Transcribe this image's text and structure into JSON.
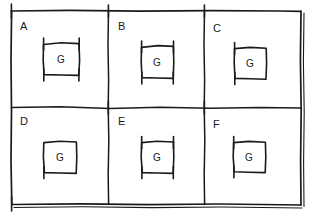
{
  "figure": {
    "type": "hand-drawn-diagram",
    "ink_color": "#1a1a1a",
    "background_color": "#ffffff",
    "rows": 2,
    "columns": 3
  },
  "panels": [
    {
      "id": "panel-a",
      "label": "A",
      "label_x": 20,
      "label_y": 20,
      "inner_box": {
        "label": "G",
        "x": 43,
        "y": 42,
        "width": 36,
        "height": 33,
        "ticks": [
          "top-left",
          "top-right",
          "bottom-left",
          "bottom-right"
        ]
      }
    },
    {
      "id": "panel-b",
      "label": "B",
      "label_x": 118,
      "label_y": 20,
      "inner_box": {
        "label": "G",
        "x": 141,
        "y": 45,
        "width": 32,
        "height": 33,
        "ticks": [
          "top-left",
          "top-right",
          "bottom-left",
          "bottom-right"
        ]
      }
    },
    {
      "id": "panel-c",
      "label": "C",
      "label_x": 213,
      "label_y": 22,
      "inner_box": {
        "label": "G",
        "x": 234,
        "y": 48,
        "width": 32,
        "height": 31,
        "ticks": [
          "top-left",
          "bottom-left"
        ]
      }
    },
    {
      "id": "panel-d",
      "label": "D",
      "label_x": 20,
      "label_y": 115,
      "inner_box": {
        "label": "G",
        "x": 43,
        "y": 141,
        "width": 33,
        "height": 32,
        "ticks": [
          "bottom-left"
        ]
      }
    },
    {
      "id": "panel-e",
      "label": "E",
      "label_x": 118,
      "label_y": 115,
      "inner_box": {
        "label": "G",
        "x": 141,
        "y": 141,
        "width": 32,
        "height": 32,
        "ticks": [
          "top-left",
          "top-right",
          "bottom-left",
          "bottom-right"
        ]
      }
    },
    {
      "id": "panel-f",
      "label": "F",
      "label_x": 213,
      "label_y": 118,
      "inner_box": {
        "label": "G",
        "x": 233,
        "y": 141,
        "width": 32,
        "height": 31,
        "ticks": [
          "top-left",
          "bottom-left"
        ]
      }
    }
  ],
  "frame": {
    "corner_ticks": [
      "top-left",
      "bottom-left"
    ],
    "double_stroke_edges": [
      "right",
      "bottom"
    ]
  }
}
